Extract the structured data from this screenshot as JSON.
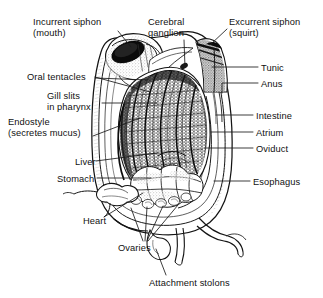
{
  "figure": {
    "style": "black-and-white engraving / line drawing with stipple and hatch shading",
    "background_color": "#ffffff",
    "ink_color": "#111111",
    "width": 323,
    "height": 298
  },
  "labels": [
    {
      "id": "incurrent-siphon",
      "line1": "Incurrent siphon",
      "line2": "(mouth)",
      "side": "left",
      "x": 33,
      "y": 17
    },
    {
      "id": "cerebral-ganglion",
      "line1": "Cerebral",
      "line2": "ganglion",
      "side": "top",
      "x": 148,
      "y": 17
    },
    {
      "id": "excurrent-siphon",
      "line1": "Excurrent siphon",
      "line2": "(squirt)",
      "side": "right",
      "x": 229,
      "y": 17
    },
    {
      "id": "tunic",
      "line1": "Tunic",
      "line2": "",
      "side": "right",
      "x": 261,
      "y": 63
    },
    {
      "id": "oral-tentacles",
      "line1": "Oral tentacles",
      "line2": "",
      "side": "left",
      "x": 27,
      "y": 72
    },
    {
      "id": "anus",
      "line1": "Anus",
      "line2": "",
      "side": "right",
      "x": 261,
      "y": 79
    },
    {
      "id": "gill-slits",
      "line1": "Gill slits",
      "line2": "in pharynx",
      "side": "left",
      "x": 47,
      "y": 91
    },
    {
      "id": "intestine",
      "line1": "Intestine",
      "line2": "",
      "side": "right",
      "x": 256,
      "y": 111
    },
    {
      "id": "endostyle",
      "line1": "Endostyle",
      "line2": "(secretes mucus)",
      "side": "left",
      "x": 8,
      "y": 117
    },
    {
      "id": "atrium",
      "line1": "Atrium",
      "line2": "",
      "side": "right",
      "x": 256,
      "y": 128
    },
    {
      "id": "oviduct",
      "line1": "Oviduct",
      "line2": "",
      "side": "right",
      "x": 256,
      "y": 144
    },
    {
      "id": "liver",
      "line1": "Liver",
      "line2": "",
      "side": "left",
      "x": 75,
      "y": 157
    },
    {
      "id": "stomach",
      "line1": "Stomach",
      "line2": "",
      "side": "left",
      "x": 57,
      "y": 174
    },
    {
      "id": "esophagus",
      "line1": "Esophagus",
      "line2": "",
      "side": "right",
      "x": 253,
      "y": 177
    },
    {
      "id": "heart",
      "line1": "Heart",
      "line2": "",
      "side": "left",
      "x": 83,
      "y": 216
    },
    {
      "id": "ovaries",
      "line1": "Ovaries",
      "line2": "",
      "side": "bottom",
      "x": 118,
      "y": 243
    },
    {
      "id": "attachment-stolons",
      "line1": "Attachment stolons",
      "line2": "",
      "side": "bottom",
      "x": 149,
      "y": 278
    }
  ],
  "leaders": [
    {
      "id": "incurrent-siphon-leader",
      "path": "M118,31 L131,47"
    },
    {
      "id": "cerebral-ganglion-leader",
      "path": "M184,40 L185,67"
    },
    {
      "id": "excurrent-siphon-leader",
      "path": "M227,29 L210,45"
    },
    {
      "id": "tunic-leader",
      "path": "M258,67 L212,67"
    },
    {
      "id": "anus-leader",
      "path": "M258,83 L222,83 L222,93"
    },
    {
      "id": "intestine-leader",
      "path": "M253,115 L216,115"
    },
    {
      "id": "atrium-leader",
      "path": "M253,132 L211,132"
    },
    {
      "id": "oviduct-leader",
      "path": "M253,148 L205,148"
    },
    {
      "id": "esophagus-leader",
      "path": "M250,181 L214,181"
    },
    {
      "id": "oral-tentacles-leader-a",
      "path": "M95,77 L150,92"
    },
    {
      "id": "oral-tentacles-leader-b",
      "path": "M95,78 L148,80"
    },
    {
      "id": "gill-slits-leader",
      "path": "M102,103 L157,103"
    },
    {
      "id": "endostyle-leader",
      "path": "M93,136 L140,118"
    },
    {
      "id": "liver-leader",
      "path": "M96,161 L157,153"
    },
    {
      "id": "stomach-leader",
      "path": "M97,178 L151,178"
    },
    {
      "id": "heart-leader",
      "path": "M104,217 L143,193"
    },
    {
      "id": "ovaries-leader-a",
      "path": "M143,241 L131,208"
    },
    {
      "id": "ovaries-leader-b",
      "path": "M145,241 L147,207"
    },
    {
      "id": "ovaries-leader-c",
      "path": "M147,241 L163,206"
    },
    {
      "id": "ovaries-leader-d",
      "path": "M148,241 L178,205"
    },
    {
      "id": "stolons-leader",
      "path": "M166,275 L156,249"
    }
  ]
}
